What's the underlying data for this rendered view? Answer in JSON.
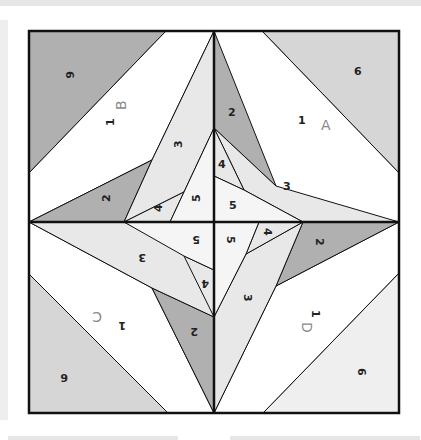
{
  "diagram": {
    "colors": {
      "dark": "#b0b0b0",
      "medium": "#d6d6d6",
      "light": "#e8e8e8",
      "white": "#ffffff",
      "lighter": "#f2f2f2",
      "line": "#111111",
      "section_letter": "#8a8a8a"
    },
    "sections": [
      {
        "letter": "A",
        "pieces": [
          "1",
          "2",
          "3",
          "4",
          "5",
          "6"
        ]
      },
      {
        "letter": "B",
        "pieces": [
          "1",
          "2",
          "3",
          "4",
          "5",
          "6"
        ]
      },
      {
        "letter": "C",
        "pieces": [
          "1",
          "2",
          "3",
          "4",
          "5",
          "6"
        ]
      },
      {
        "letter": "D",
        "pieces": [
          "1",
          "2",
          "3",
          "4",
          "5",
          "6"
        ]
      }
    ]
  }
}
